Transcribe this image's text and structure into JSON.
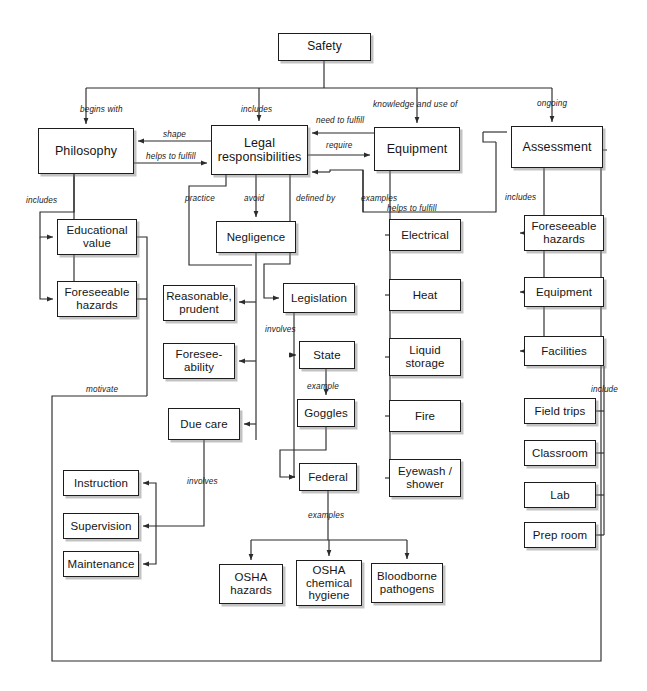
{
  "diagram": {
    "title": "Safety",
    "type": "concept-map",
    "nodes": [
      {
        "id": "safety",
        "label": "Safety",
        "x": 278,
        "y": 33,
        "w": 93,
        "h": 28
      },
      {
        "id": "philosophy",
        "label": "Philosophy",
        "x": 38,
        "y": 128,
        "w": 96,
        "h": 46
      },
      {
        "id": "legal",
        "label": "Legal responsibilities",
        "x": 211,
        "y": 125,
        "w": 97,
        "h": 50
      },
      {
        "id": "equipment_top",
        "label": "Equipment",
        "x": 374,
        "y": 127,
        "w": 86,
        "h": 44
      },
      {
        "id": "assessment",
        "label": "Assessment",
        "x": 511,
        "y": 126,
        "w": 92,
        "h": 42
      },
      {
        "id": "educational_value",
        "label": "Educational value",
        "x": 57,
        "y": 219,
        "w": 80,
        "h": 36
      },
      {
        "id": "foreseeable_haz_l",
        "label": "Foreseeable hazards",
        "x": 57,
        "y": 281,
        "w": 80,
        "h": 36
      },
      {
        "id": "negligence",
        "label": "Negligence",
        "x": 216,
        "y": 221,
        "w": 80,
        "h": 32
      },
      {
        "id": "reasonable",
        "label": "Reasonable, prudent",
        "x": 163,
        "y": 285,
        "w": 72,
        "h": 36
      },
      {
        "id": "foreseeability",
        "label": "Foresee- ability",
        "x": 163,
        "y": 343,
        "w": 72,
        "h": 36
      },
      {
        "id": "due_care",
        "label": "Due care",
        "x": 168,
        "y": 408,
        "w": 72,
        "h": 32
      },
      {
        "id": "instruction",
        "label": "Instruction",
        "x": 63,
        "y": 470,
        "w": 76,
        "h": 26
      },
      {
        "id": "supervision",
        "label": "Supervision",
        "x": 63,
        "y": 513,
        "w": 76,
        "h": 26
      },
      {
        "id": "maintenance",
        "label": "Maintenance",
        "x": 63,
        "y": 551,
        "w": 76,
        "h": 26
      },
      {
        "id": "legislation",
        "label": "Legislation",
        "x": 283,
        "y": 283,
        "w": 72,
        "h": 30
      },
      {
        "id": "state",
        "label": "State",
        "x": 299,
        "y": 341,
        "w": 56,
        "h": 28
      },
      {
        "id": "goggles",
        "label": "Goggles",
        "x": 297,
        "y": 399,
        "w": 58,
        "h": 28
      },
      {
        "id": "federal",
        "label": "Federal",
        "x": 299,
        "y": 463,
        "w": 58,
        "h": 28
      },
      {
        "id": "osha_hazards",
        "label": "OSHA hazards",
        "x": 219,
        "y": 564,
        "w": 64,
        "h": 40
      },
      {
        "id": "osha_chem",
        "label": "OSHA chemical hygiene",
        "x": 296,
        "y": 560,
        "w": 66,
        "h": 46
      },
      {
        "id": "bloodborne",
        "label": "Bloodborne pathogens",
        "x": 371,
        "y": 563,
        "w": 72,
        "h": 40
      },
      {
        "id": "electrical",
        "label": "Electrical",
        "x": 389,
        "y": 219,
        "w": 72,
        "h": 32
      },
      {
        "id": "heat",
        "label": "Heat",
        "x": 389,
        "y": 279,
        "w": 72,
        "h": 32
      },
      {
        "id": "liquid_storage",
        "label": "Liquid storage",
        "x": 389,
        "y": 338,
        "w": 72,
        "h": 38
      },
      {
        "id": "fire",
        "label": "Fire",
        "x": 389,
        "y": 400,
        "w": 72,
        "h": 32
      },
      {
        "id": "eyewash",
        "label": "Eyewash / shower",
        "x": 389,
        "y": 459,
        "w": 72,
        "h": 38
      },
      {
        "id": "foreseeable_haz_r",
        "label": "Foreseeable hazards",
        "x": 524,
        "y": 215,
        "w": 80,
        "h": 36
      },
      {
        "id": "equipment_r",
        "label": "Equipment",
        "x": 524,
        "y": 277,
        "w": 80,
        "h": 30
      },
      {
        "id": "facilities",
        "label": "Facilities",
        "x": 524,
        "y": 336,
        "w": 80,
        "h": 30
      },
      {
        "id": "field_trips",
        "label": "Field trips",
        "x": 524,
        "y": 398,
        "w": 72,
        "h": 26
      },
      {
        "id": "classroom",
        "label": "Classroom",
        "x": 524,
        "y": 440,
        "w": 72,
        "h": 26
      },
      {
        "id": "lab",
        "label": "Lab",
        "x": 524,
        "y": 482,
        "w": 72,
        "h": 26
      },
      {
        "id": "prep_room",
        "label": "Prep room",
        "x": 524,
        "y": 522,
        "w": 72,
        "h": 26
      }
    ],
    "edge_labels": [
      {
        "id": "lbl-begins-with",
        "text": "begins with",
        "x": 80,
        "y": 105
      },
      {
        "id": "lbl-includes-top",
        "text": "includes",
        "x": 241,
        "y": 105
      },
      {
        "id": "lbl-knowledge-use-of",
        "text": "knowledge and use of",
        "x": 373,
        "y": 99
      },
      {
        "id": "lbl-ongoing",
        "text": "ongoing",
        "x": 537,
        "y": 99
      },
      {
        "id": "lbl-shape",
        "text": "shape",
        "x": 163,
        "y": 130
      },
      {
        "id": "lbl-helps-to-fulfill-1",
        "text": "helps to fulfill",
        "x": 146,
        "y": 152
      },
      {
        "id": "lbl-need-to-fulfill",
        "text": "need to fulfill",
        "x": 316,
        "y": 116
      },
      {
        "id": "lbl-require",
        "text": "require",
        "x": 326,
        "y": 141
      },
      {
        "id": "lbl-includes-phil",
        "text": "includes",
        "x": 26,
        "y": 196
      },
      {
        "id": "lbl-practice",
        "text": "practice",
        "x": 185,
        "y": 194
      },
      {
        "id": "lbl-avoid",
        "text": "avoid",
        "x": 244,
        "y": 194
      },
      {
        "id": "lbl-defined-by",
        "text": "defined by",
        "x": 296,
        "y": 194
      },
      {
        "id": "lbl-examples-equip",
        "text": "examples",
        "x": 361,
        "y": 194
      },
      {
        "id": "lbl-helps-to-fulfill-2",
        "text": "helps to fulfill",
        "x": 387,
        "y": 204
      },
      {
        "id": "lbl-includes-assess",
        "text": "includes",
        "x": 505,
        "y": 193
      },
      {
        "id": "lbl-involves-legis",
        "text": "involves",
        "x": 265,
        "y": 325
      },
      {
        "id": "lbl-example-state",
        "text": "example",
        "x": 307,
        "y": 382
      },
      {
        "id": "lbl-include-fac",
        "text": "include",
        "x": 591,
        "y": 385
      },
      {
        "id": "lbl-motivate",
        "text": "motivate",
        "x": 86,
        "y": 385
      },
      {
        "id": "lbl-involves-duecare",
        "text": "involves",
        "x": 187,
        "y": 477
      },
      {
        "id": "lbl-examples-federal",
        "text": "examples",
        "x": 308,
        "y": 511
      }
    ],
    "colors": {
      "background": "#ffffff",
      "box_border": "#1d1d1d",
      "box_fill": "#ffffff",
      "line": "#2b2b2b",
      "text": "#151515"
    }
  }
}
